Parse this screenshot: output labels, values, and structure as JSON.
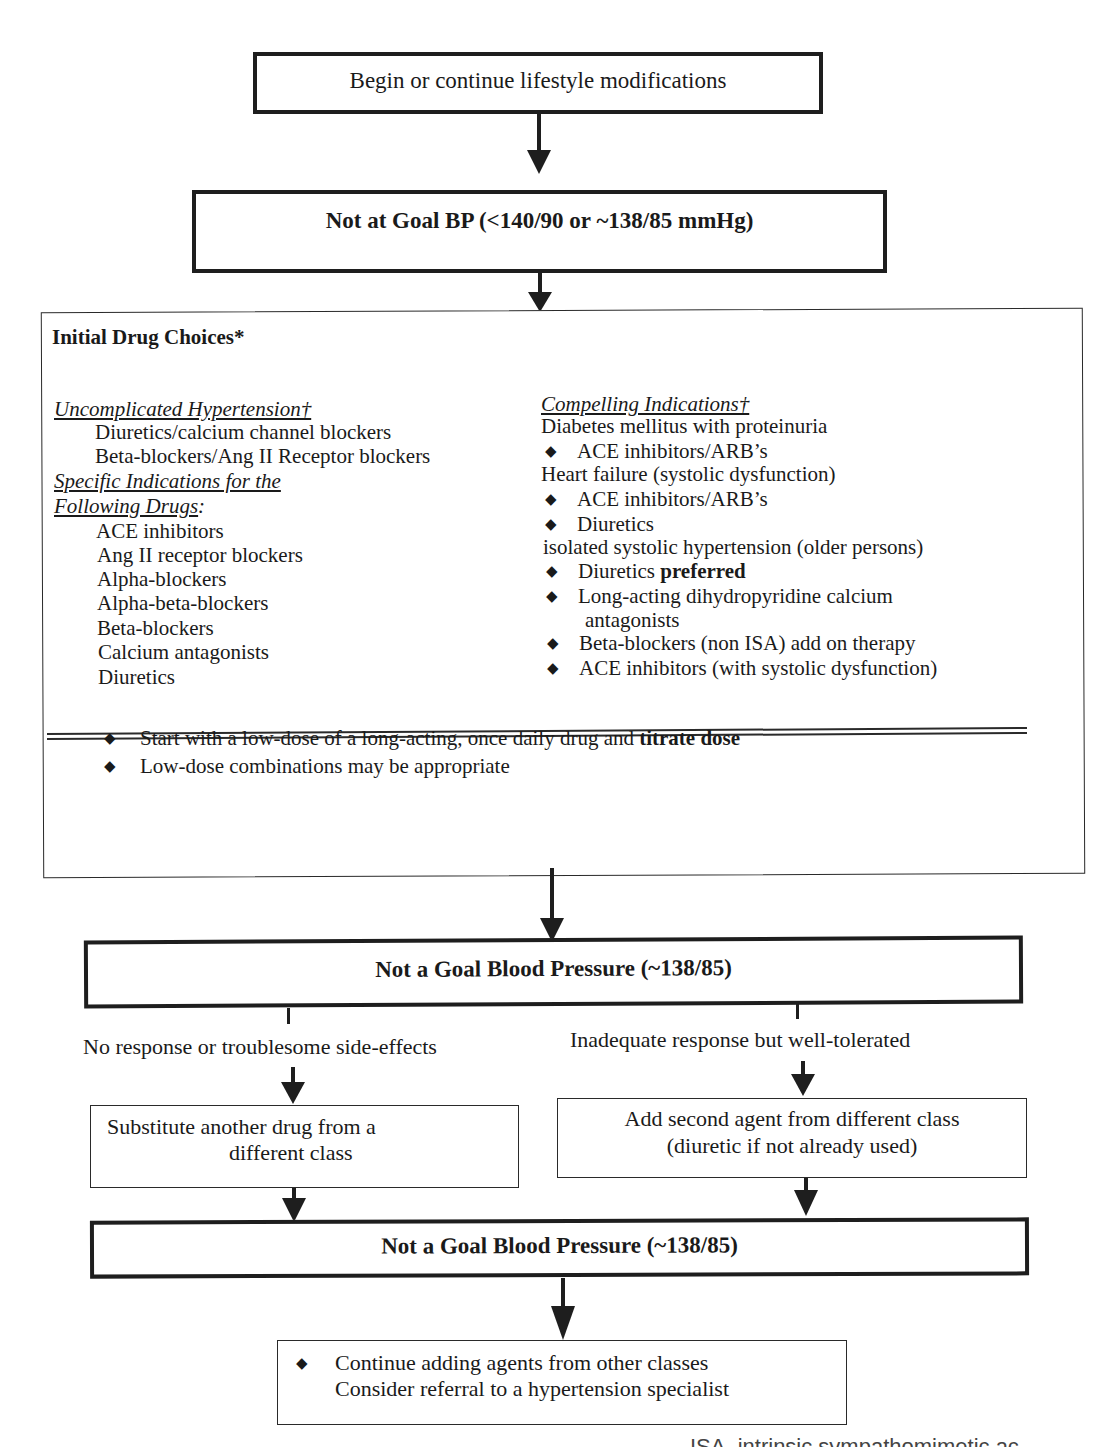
{
  "flowchart": {
    "step1": {
      "label": "Begin or continue lifestyle modifications"
    },
    "step2": {
      "label": "Not at Goal BP (<140/90 or ~138/85 mmHg)"
    },
    "initial_drugs": {
      "title": "Initial Drug Choices*",
      "uncomplicated": {
        "heading": "Uncomplicated Hypertension†",
        "items": [
          "Diuretics/calcium channel blockers",
          "Beta-blockers/Ang II Receptor blockers"
        ]
      },
      "specific": {
        "heading_line1": "Specific Indications for the",
        "heading_line2": "Following Drugs",
        "heading_colon": ":",
        "items": [
          "ACE inhibitors",
          "Ang II receptor blockers",
          "Alpha-blockers",
          "Alpha-beta-blockers",
          "Beta-blockers",
          "Calcium antagonists",
          "Diuretics"
        ]
      },
      "compelling": {
        "heading": "Compelling Indications†",
        "lines": {
          "diabetes": "Diabetes mellitus with proteinuria",
          "diabetes_b1": "ACE inhibitors/ARB’s",
          "heart_failure": "Heart failure (systolic dysfunction)",
          "hf_b1": "ACE inhibitors/ARB’s",
          "hf_b2": "Diuretics",
          "isolated": "isolated systolic hypertension (older persons)",
          "iso_b1_text": "Diuretics ",
          "iso_b1_bold": "preferred",
          "iso_b2_line1": "Long-acting dihydropyridine calcium",
          "iso_b2_line2": "antagonists",
          "iso_b3": "Beta-blockers (non ISA) add on therapy",
          "iso_b4": "ACE inhibitors (with systolic dysfunction)"
        }
      },
      "notes": {
        "note1_text": "Start with a low-dose of a long-acting, once daily drug and ",
        "note1_bold": "titrate dose",
        "note2": "Low-dose combinations may be appropriate"
      }
    },
    "step3": {
      "label": "Not a Goal Blood Pressure (~138/85)"
    },
    "branch_left": {
      "condition": "No response or troublesome side-effects",
      "action_line1": "Substitute another drug from a",
      "action_line2": "different class"
    },
    "branch_right": {
      "condition": "Inadequate response but well-tolerated",
      "action_line1": "Add second agent from different class",
      "action_line2": "(diuretic if not already used)"
    },
    "step4": {
      "label": "Not a Goal Blood Pressure (~138/85)"
    },
    "final": {
      "line1": "Continue adding agents from other classes",
      "line2": "Consider referral to a hypertension specialist"
    },
    "footnote_cutoff": "ISA, intrinsic sympathomimetic ac"
  },
  "icons": {
    "bullet": "◆"
  }
}
